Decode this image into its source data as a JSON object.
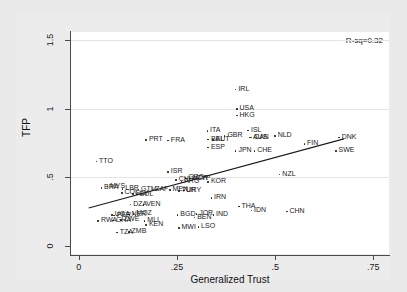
{
  "chart_data": {
    "type": "scatter",
    "title": "",
    "xlabel": "Generalized Trust",
    "ylabel": "TFP",
    "xlim": [
      -0.02,
      0.79
    ],
    "ylim": [
      -0.06,
      1.56
    ],
    "xticks": [
      "0",
      ".25",
      ".5",
      ".75"
    ],
    "xtick_values": [
      0,
      0.25,
      0.5,
      0.75
    ],
    "yticks": [
      "0",
      ".5",
      "1",
      "1.5"
    ],
    "ytick_values": [
      0,
      0.5,
      1,
      1.5
    ],
    "grid": "horizontal",
    "annotation": "R-sq=0.32",
    "fit_line": {
      "x0": 0.025,
      "y0": 0.275,
      "x1": 0.675,
      "y1": 0.78
    },
    "point_label_type": "country-iso3",
    "points": [
      {
        "label": "IRL",
        "x": 0.4,
        "y": 1.14
      },
      {
        "label": "USA",
        "x": 0.403,
        "y": 0.995
      },
      {
        "label": "HKG",
        "x": 0.403,
        "y": 0.95
      },
      {
        "label": "ISL",
        "x": 0.432,
        "y": 0.84
      },
      {
        "label": "ITA",
        "x": 0.328,
        "y": 0.835
      },
      {
        "label": "GBR",
        "x": 0.372,
        "y": 0.8
      },
      {
        "label": "NLD",
        "x": 0.5,
        "y": 0.8
      },
      {
        "label": "DNK",
        "x": 0.663,
        "y": 0.79
      },
      {
        "label": "AUS",
        "x": 0.437,
        "y": 0.79
      },
      {
        "label": "CAN",
        "x": 0.44,
        "y": 0.788
      },
      {
        "label": "BEL",
        "x": 0.33,
        "y": 0.775
      },
      {
        "label": "AUT",
        "x": 0.342,
        "y": 0.772
      },
      {
        "label": "PRT",
        "x": 0.172,
        "y": 0.77
      },
      {
        "label": "FRA",
        "x": 0.228,
        "y": 0.768
      },
      {
        "label": "FIN",
        "x": 0.575,
        "y": 0.74
      },
      {
        "label": "ESP",
        "x": 0.33,
        "y": 0.715
      },
      {
        "label": "SWE",
        "x": 0.655,
        "y": 0.692
      },
      {
        "label": "JPN",
        "x": 0.4,
        "y": 0.69
      },
      {
        "label": "CHE",
        "x": 0.448,
        "y": 0.69
      },
      {
        "label": "TTO",
        "x": 0.045,
        "y": 0.615
      },
      {
        "label": "NZL",
        "x": 0.512,
        "y": 0.52
      },
      {
        "label": "ISR",
        "x": 0.228,
        "y": 0.535
      },
      {
        "label": "GRC",
        "x": 0.272,
        "y": 0.492
      },
      {
        "label": "NOR",
        "x": 0.283,
        "y": 0.49
      },
      {
        "label": "CYP",
        "x": 0.292,
        "y": 0.488
      },
      {
        "label": "CHL",
        "x": 0.248,
        "y": 0.478
      },
      {
        "label": "ARG",
        "x": 0.262,
        "y": 0.462
      },
      {
        "label": "KOR",
        "x": 0.33,
        "y": 0.465
      },
      {
        "label": "MYS",
        "x": 0.073,
        "y": 0.43
      },
      {
        "label": "BRA",
        "x": 0.058,
        "y": 0.42
      },
      {
        "label": "LBR",
        "x": 0.112,
        "y": 0.412
      },
      {
        "label": "GTM",
        "x": 0.152,
        "y": 0.41
      },
      {
        "label": "ZAF",
        "x": 0.188,
        "y": 0.408
      },
      {
        "label": "MEX",
        "x": 0.232,
        "y": 0.405
      },
      {
        "label": "URY",
        "x": 0.268,
        "y": 0.402
      },
      {
        "label": "TUR",
        "x": 0.255,
        "y": 0.398
      },
      {
        "label": "COL",
        "x": 0.11,
        "y": 0.382
      },
      {
        "label": "SLV",
        "x": 0.138,
        "y": 0.378
      },
      {
        "label": "BOL",
        "x": 0.148,
        "y": 0.372
      },
      {
        "label": "IRN",
        "x": 0.338,
        "y": 0.348
      },
      {
        "label": "DZA",
        "x": 0.132,
        "y": 0.3
      },
      {
        "label": "VEN",
        "x": 0.165,
        "y": 0.298
      },
      {
        "label": "THA",
        "x": 0.408,
        "y": 0.285
      },
      {
        "label": "IDN",
        "x": 0.44,
        "y": 0.255
      },
      {
        "label": "CHN",
        "x": 0.53,
        "y": 0.248
      },
      {
        "label": "MOZ",
        "x": 0.14,
        "y": 0.232
      },
      {
        "label": "NER",
        "x": 0.128,
        "y": 0.228
      },
      {
        "label": "UGA",
        "x": 0.085,
        "y": 0.222
      },
      {
        "label": "PER",
        "x": 0.09,
        "y": 0.218
      },
      {
        "label": "BGD",
        "x": 0.252,
        "y": 0.225
      },
      {
        "label": "JOR",
        "x": 0.3,
        "y": 0.232
      },
      {
        "label": "BEN",
        "x": 0.295,
        "y": 0.205
      },
      {
        "label": "IND",
        "x": 0.343,
        "y": 0.225
      },
      {
        "label": "ZWE",
        "x": 0.108,
        "y": 0.185
      },
      {
        "label": "GHA",
        "x": 0.088,
        "y": 0.182
      },
      {
        "label": "RWA",
        "x": 0.05,
        "y": 0.178
      },
      {
        "label": "MLI",
        "x": 0.168,
        "y": 0.18
      },
      {
        "label": "KEN",
        "x": 0.172,
        "y": 0.152
      },
      {
        "label": "MWI",
        "x": 0.255,
        "y": 0.13
      },
      {
        "label": "LSO",
        "x": 0.305,
        "y": 0.135
      },
      {
        "label": "TZA",
        "x": 0.098,
        "y": 0.095
      },
      {
        "label": "ZMB",
        "x": 0.128,
        "y": 0.098
      }
    ]
  }
}
